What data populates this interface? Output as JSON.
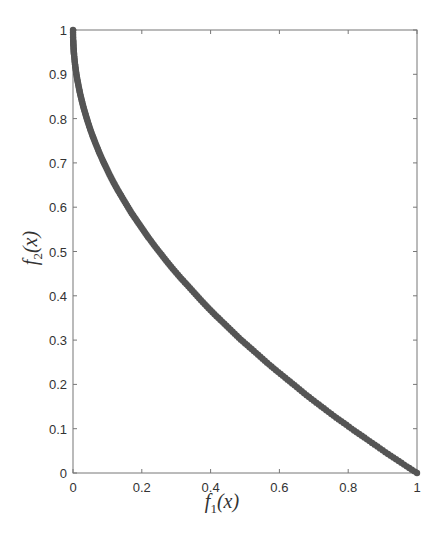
{
  "chart_data": {
    "type": "scatter",
    "title": "",
    "xlabel": "f_1(x)",
    "ylabel": "f_2(x)",
    "xlabel_parts": {
      "base": "f",
      "sub": "1",
      "rest": "(x)"
    },
    "ylabel_parts": {
      "base": "f",
      "sub": "2",
      "rest": "(x)"
    },
    "xlim": [
      0,
      1
    ],
    "ylim": [
      0,
      1
    ],
    "xticks": [
      "0",
      "0.2",
      "0.4",
      "0.6",
      "0.8",
      "1"
    ],
    "yticks": [
      "0",
      "0.1",
      "0.2",
      "0.3",
      "0.4",
      "0.5",
      "0.6",
      "0.7",
      "0.8",
      "0.9",
      "1"
    ],
    "grid": false,
    "legend": null,
    "marker_color": "#555555",
    "series": [
      {
        "name": "Pareto front (f2 = 1 - sqrt(f1))",
        "x": [
          0.0,
          0.0005,
          0.001,
          0.002,
          0.003,
          0.005,
          0.007,
          0.01,
          0.013,
          0.017,
          0.021,
          0.026,
          0.031,
          0.037,
          0.043,
          0.05,
          0.058,
          0.066,
          0.075,
          0.085,
          0.095,
          0.106,
          0.118,
          0.13,
          0.143,
          0.157,
          0.171,
          0.186,
          0.202,
          0.218,
          0.235,
          0.253,
          0.271,
          0.29,
          0.31,
          0.33,
          0.351,
          0.372,
          0.394,
          0.417,
          0.44,
          0.464,
          0.488,
          0.513,
          0.538,
          0.564,
          0.59,
          0.617,
          0.644,
          0.672,
          0.7,
          0.729,
          0.758,
          0.787,
          0.817,
          0.847,
          0.877,
          0.908,
          0.939,
          0.97,
          1.0
        ],
        "y": [
          1.0,
          0.978,
          0.968,
          0.955,
          0.945,
          0.929,
          0.916,
          0.9,
          0.886,
          0.87,
          0.855,
          0.839,
          0.824,
          0.808,
          0.793,
          0.776,
          0.759,
          0.743,
          0.726,
          0.708,
          0.692,
          0.674,
          0.656,
          0.639,
          0.622,
          0.604,
          0.586,
          0.569,
          0.551,
          0.533,
          0.515,
          0.497,
          0.479,
          0.461,
          0.443,
          0.426,
          0.408,
          0.39,
          0.372,
          0.354,
          0.337,
          0.319,
          0.301,
          0.284,
          0.267,
          0.249,
          0.232,
          0.215,
          0.198,
          0.18,
          0.163,
          0.146,
          0.129,
          0.113,
          0.096,
          0.08,
          0.064,
          0.047,
          0.031,
          0.015,
          0.0
        ]
      }
    ]
  }
}
